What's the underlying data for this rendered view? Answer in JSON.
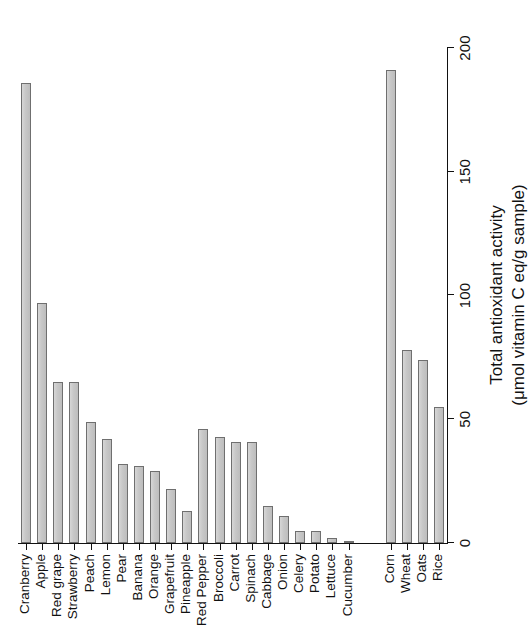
{
  "figure": {
    "kind": "bar-chart",
    "orientation": "rotated-90-ccw",
    "background": "#ffffff",
    "bar_fill": "#c9c9c9",
    "bar_stroke": "#6f6f6f",
    "axis_color": "#111111"
  },
  "axis": {
    "title_line1": "Total antioxidant activity",
    "title_line2": "(μmol vitamin C eq/g sample)",
    "ticks": [
      "0",
      "50",
      "100",
      "150",
      "200"
    ]
  },
  "chart_data": {
    "type": "bar",
    "title": "",
    "xlabel": "",
    "ylabel": "Total antioxidant activity (μmol vitamin C eq/g sample)",
    "ylim": [
      0,
      200
    ],
    "yticks": [
      0,
      50,
      100,
      150,
      200
    ],
    "grid": false,
    "legend": "none",
    "orientation": "vertical",
    "gap_after_index": 20,
    "categories": [
      "Cranberry",
      "Apple",
      "Red grape",
      "Strawberry",
      "Peach",
      "Lemon",
      "Pear",
      "Banana",
      "Orange",
      "Grapefruit",
      "Pineapple",
      "Red Pepper",
      "Broccoli",
      "Carrot",
      "Spinach",
      "Cabbage",
      "Onion",
      "Celery",
      "Potato",
      "Lettuce",
      "Cucumber",
      "Corn",
      "Wheat",
      "Oats",
      "Rice"
    ],
    "values": [
      186,
      97,
      65,
      65,
      49,
      42,
      32,
      31,
      29,
      22,
      13,
      46,
      43,
      41,
      41,
      15,
      11,
      5,
      5,
      2,
      1,
      191,
      78,
      74,
      55
    ]
  }
}
